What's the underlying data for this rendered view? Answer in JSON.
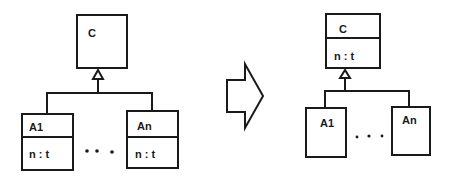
{
  "diagram": {
    "type": "uml-class-refactoring",
    "before": {
      "superclass": {
        "name": "C",
        "attributes": []
      },
      "subclasses": [
        {
          "name": "A1",
          "attribute": "n : t"
        },
        {
          "name": "An",
          "attribute": "n : t"
        }
      ],
      "ellipsis": "• • •"
    },
    "transform_arrow": "right-block-arrow",
    "after": {
      "superclass": {
        "name": "C",
        "attribute": "n : t"
      },
      "subclasses": [
        {
          "name": "A1"
        },
        {
          "name": "An"
        }
      ],
      "ellipsis": "• • •"
    }
  }
}
